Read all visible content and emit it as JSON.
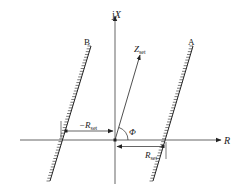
{
  "diagram": {
    "axes": {
      "vertical_label_prefix": "j",
      "vertical_label_var": "X",
      "horizontal_label": "R"
    },
    "lines": {
      "left_label": "B",
      "right_label": "A"
    },
    "vector": {
      "label_main": "Z",
      "label_sub": "set"
    },
    "angle_label": "Φ",
    "dimensions": {
      "left_main": "−R",
      "left_sub": "set",
      "right_main": "R",
      "right_sub": "set"
    },
    "colors": {
      "ink": "#222222",
      "background": "#ffffff"
    }
  }
}
